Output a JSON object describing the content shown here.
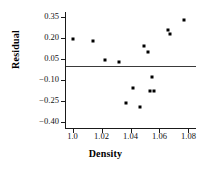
{
  "chart_data": {
    "type": "scatter",
    "title": "",
    "xlabel": "Density",
    "ylabel": "Residual",
    "xlim": [
      0.9955,
      1.0845
    ],
    "ylim": [
      -0.445,
      0.385
    ],
    "grid": false,
    "legend": null,
    "xticks": [
      1.0,
      1.02,
      1.04,
      1.06,
      1.08
    ],
    "xticklabels": [
      "1.0",
      "1.02",
      "1.04",
      "1.06",
      "1.08"
    ],
    "yticks": [
      0.35,
      0.2,
      0.05,
      -0.1,
      -0.25,
      -0.4
    ],
    "yticklabels": [
      "0.35",
      "0.20",
      "0.05",
      "−0.10",
      "−0.25",
      "−0.40"
    ],
    "reference_line": {
      "orientation": "horizontal",
      "y": 0.0
    },
    "points": [
      {
        "x": 1.0006,
        "y": 0.195
      },
      {
        "x": 1.0142,
        "y": 0.176
      },
      {
        "x": 1.0223,
        "y": 0.041
      },
      {
        "x": 1.0322,
        "y": 0.028
      },
      {
        "x": 1.0372,
        "y": -0.264
      },
      {
        "x": 1.0415,
        "y": -0.161
      },
      {
        "x": 1.0465,
        "y": -0.296
      },
      {
        "x": 1.0496,
        "y": 0.143
      },
      {
        "x": 1.0521,
        "y": 0.098
      },
      {
        "x": 1.0533,
        "y": -0.18
      },
      {
        "x": 1.0546,
        "y": -0.077
      },
      {
        "x": 1.0564,
        "y": -0.18
      },
      {
        "x": 1.0658,
        "y": 0.253
      },
      {
        "x": 1.067,
        "y": 0.227
      },
      {
        "x": 1.0769,
        "y": 0.331
      }
    ]
  }
}
